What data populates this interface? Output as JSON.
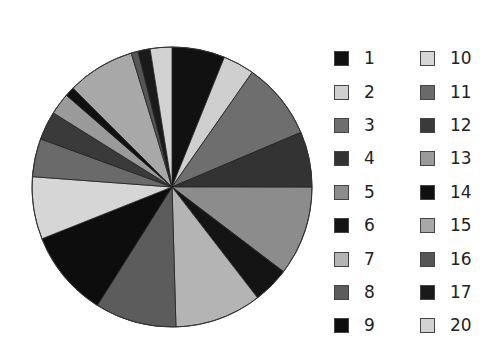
{
  "chart_data": {
    "type": "pie",
    "title": "",
    "start_angle_deg": 0,
    "direction": "clockwise",
    "legend_position": "right",
    "categories": [
      "1",
      "2",
      "3",
      "4",
      "5",
      "6",
      "7",
      "8",
      "9",
      "10",
      "11",
      "12",
      "13",
      "14",
      "15",
      "16",
      "17",
      "20"
    ],
    "values": [
      6.1,
      3.6,
      8.9,
      6.4,
      10.3,
      4.2,
      10.0,
      9.4,
      10.0,
      7.2,
      4.4,
      3.3,
      2.5,
      1.1,
      7.8,
      0.8,
      1.4,
      2.5
    ],
    "colors": [
      "#111111",
      "#cfcfcf",
      "#6e6e6e",
      "#333333",
      "#8c8c8c",
      "#141414",
      "#b4b4b4",
      "#5c5c5c",
      "#0d0d0d",
      "#d6d6d6",
      "#6a6a6a",
      "#3a3a3a",
      "#9a9a9a",
      "#101010",
      "#a8a8a8",
      "#555555",
      "#1a1a1a",
      "#d2d2d2"
    ]
  },
  "legend": {
    "col1": [
      {
        "label": "1",
        "color": "#111111"
      },
      {
        "label": "2",
        "color": "#cfcfcf"
      },
      {
        "label": "3",
        "color": "#6e6e6e"
      },
      {
        "label": "4",
        "color": "#333333"
      },
      {
        "label": "5",
        "color": "#8c8c8c"
      },
      {
        "label": "6",
        "color": "#141414"
      },
      {
        "label": "7",
        "color": "#b4b4b4"
      },
      {
        "label": "8",
        "color": "#5c5c5c"
      },
      {
        "label": "9",
        "color": "#0d0d0d"
      }
    ],
    "col2": [
      {
        "label": "10",
        "color": "#d6d6d6"
      },
      {
        "label": "11",
        "color": "#6a6a6a"
      },
      {
        "label": "12",
        "color": "#3a3a3a"
      },
      {
        "label": "13",
        "color": "#9a9a9a"
      },
      {
        "label": "14",
        "color": "#101010"
      },
      {
        "label": "15",
        "color": "#a8a8a8"
      },
      {
        "label": "16",
        "color": "#555555"
      },
      {
        "label": "17",
        "color": "#1a1a1a"
      },
      {
        "label": "20",
        "color": "#d2d2d2"
      }
    ]
  }
}
